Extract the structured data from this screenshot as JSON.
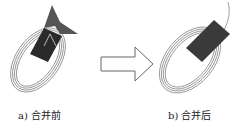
{
  "figure": {
    "panels": [
      {
        "id": "a",
        "caption": "a) 合并前",
        "description": "loop coil with dark mesh patch and folded fin-shaped surface, separate pieces"
      },
      {
        "id": "b",
        "caption": "b) 合并后",
        "description": "loop coil with single merged dark rectangular patch"
      }
    ],
    "arrow": {
      "direction": "right",
      "meaning": "transition"
    },
    "colors": {
      "patch_dark": "#2a2a2a",
      "fin": "#555555",
      "coil": "#888888",
      "arrow_stroke": "#666666"
    }
  }
}
